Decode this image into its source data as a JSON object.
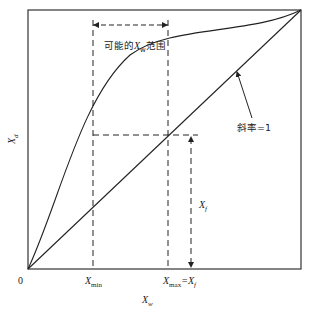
{
  "diagram": {
    "annotation_range": "可能的X_w范围",
    "annotation_range_prefix": "可能的",
    "annotation_range_var": "X",
    "annotation_range_sub": "w",
    "annotation_range_suffix": "范围",
    "slope_label": "斜率=1",
    "y_axis_label": "X",
    "y_axis_sub": "d",
    "x_axis_label": "X",
    "x_axis_sub": "w",
    "origin_label": "0",
    "tick_xmin": "X",
    "tick_xmin_sub": "min",
    "tick_xmax": "X",
    "tick_xmax_sub": "max",
    "tick_xmax_eq": "=X",
    "tick_xmax_eq_sub": "f",
    "xf_label": "X",
    "xf_sub": "f",
    "colors": {
      "line": "#222222",
      "background": "#ffffff"
    }
  }
}
